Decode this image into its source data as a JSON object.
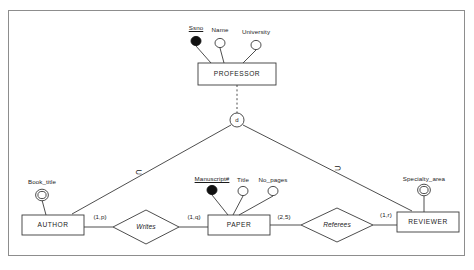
{
  "diagram": {
    "type": "er-diagram",
    "notation": "min-max (cardinality) ER with specialization",
    "colors": {
      "stroke": "#3a3a3a",
      "frame": "#8d8d8d",
      "text": "#1a1a1a",
      "fill": "#ffffff",
      "key_fill": "#111111"
    },
    "entities": [
      {
        "id": "professor",
        "label": "PROFESSOR",
        "x": 237,
        "y": 74,
        "w": 78,
        "h": 22
      },
      {
        "id": "author",
        "label": "AUTHOR",
        "x": 53,
        "y": 225,
        "w": 62,
        "h": 20
      },
      {
        "id": "paper",
        "label": "PAPER",
        "x": 239,
        "y": 225,
        "w": 62,
        "h": 20
      },
      {
        "id": "reviewer",
        "label": "REVIEWER",
        "x": 428,
        "y": 222,
        "w": 62,
        "h": 20
      }
    ],
    "relationships": [
      {
        "id": "writes",
        "label": "Writes",
        "x": 146,
        "y": 227,
        "rx": 33,
        "ry": 17
      },
      {
        "id": "referees",
        "label": "Referees",
        "x": 337,
        "y": 225,
        "rx": 36,
        "ry": 17
      }
    ],
    "attributes": [
      {
        "id": "ssno",
        "label": "Ssno",
        "owner": "professor",
        "kind": "key",
        "x": 196,
        "y": 41,
        "label_x": 196,
        "label_y": 24
      },
      {
        "id": "name",
        "label": "Name",
        "owner": "professor",
        "kind": "simple",
        "x": 220,
        "y": 43,
        "label_x": 220,
        "label_y": 26
      },
      {
        "id": "university",
        "label": "University",
        "owner": "professor",
        "kind": "simple",
        "x": 256,
        "y": 45,
        "label_x": 256,
        "label_y": 28
      },
      {
        "id": "book_title",
        "label": "Book_title",
        "owner": "author",
        "kind": "multivalued",
        "x": 42,
        "y": 195,
        "label_x": 42,
        "label_y": 178
      },
      {
        "id": "manuscript_no",
        "label": "Manuscript#",
        "owner": "paper",
        "kind": "key",
        "x": 212,
        "y": 190,
        "label_x": 212,
        "label_y": 175
      },
      {
        "id": "title",
        "label": "Title",
        "owner": "paper",
        "kind": "simple",
        "x": 243,
        "y": 191,
        "label_x": 243,
        "label_y": 176
      },
      {
        "id": "no_pages",
        "label": "No_pages",
        "owner": "paper",
        "kind": "simple",
        "x": 273,
        "y": 191,
        "label_x": 273,
        "label_y": 176
      },
      {
        "id": "specialty_area",
        "label": "Specialty_area",
        "owner": "reviewer",
        "kind": "multivalued",
        "x": 424,
        "y": 190,
        "label_x": 424,
        "label_y": 175
      }
    ],
    "specialization": {
      "id": "disjoint-circle",
      "symbol": "d",
      "x": 237,
      "y": 120,
      "r": 7,
      "superclass": "professor",
      "subclasses": [
        "author",
        "reviewer"
      ],
      "connector": "dashed"
    },
    "cardinalities": [
      {
        "id": "author-writes",
        "label": "(1,p)",
        "x": 100,
        "y": 216
      },
      {
        "id": "writes-paper",
        "label": "(1,q)",
        "x": 194,
        "y": 216
      },
      {
        "id": "paper-referees",
        "label": "(2,5)",
        "x": 284,
        "y": 216
      },
      {
        "id": "referees-reviewer",
        "label": "(1,r)",
        "x": 386,
        "y": 214
      }
    ],
    "subset_symbols": [
      {
        "id": "subset-left",
        "label": "⊂",
        "x": 139,
        "y": 173
      },
      {
        "id": "subset-right",
        "label": "⊃",
        "x": 338,
        "y": 169
      }
    ]
  }
}
